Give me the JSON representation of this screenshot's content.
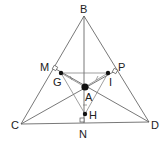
{
  "diagram": {
    "type": "geometry-triangle",
    "points": {
      "B": {
        "label": "B",
        "x": 84,
        "y": 16
      },
      "C": {
        "label": "C",
        "x": 21,
        "y": 124
      },
      "D": {
        "label": "D",
        "x": 149,
        "y": 122
      },
      "M": {
        "label": "M",
        "x": 54,
        "y": 68
      },
      "P": {
        "label": "P",
        "x": 115,
        "y": 71
      },
      "N": {
        "label": "N",
        "x": 84,
        "y": 123
      },
      "G": {
        "label": "G",
        "x": 61,
        "y": 73
      },
      "I": {
        "label": "I",
        "x": 108,
        "y": 73
      },
      "A": {
        "label": "A",
        "x": 85,
        "y": 87
      },
      "H": {
        "label": "H",
        "x": 85,
        "y": 114
      }
    },
    "labels": {
      "B": "B",
      "C": "C",
      "D": "D",
      "M": "M",
      "P": "P",
      "N": "N",
      "G": "G",
      "I": "I",
      "A": "A",
      "H": "H"
    },
    "segments": [
      [
        "B",
        "C"
      ],
      [
        "B",
        "D"
      ],
      [
        "C",
        "D"
      ],
      [
        "B",
        "N"
      ],
      [
        "C",
        "P"
      ],
      [
        "D",
        "M"
      ],
      [
        "G",
        "I"
      ],
      [
        "G",
        "H"
      ],
      [
        "I",
        "H"
      ],
      [
        "G",
        "A"
      ],
      [
        "I",
        "A"
      ],
      [
        "H",
        "A"
      ]
    ],
    "right_angles": [
      "M",
      "P",
      "N"
    ],
    "colors": {
      "line": "#555555",
      "dot": "#111111",
      "text": "#222222",
      "background": "#ffffff"
    }
  }
}
